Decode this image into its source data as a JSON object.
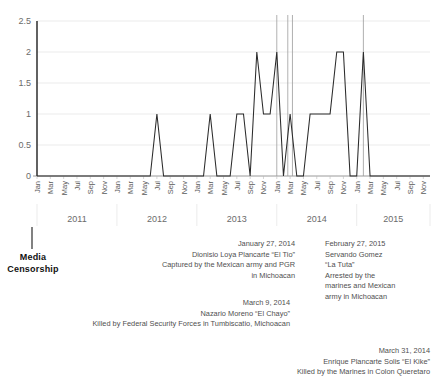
{
  "chart_data": {
    "type": "line",
    "title": "",
    "xlabel": "",
    "ylabel": "",
    "ylim": [
      0,
      2.5
    ],
    "grid": true,
    "legend": "none",
    "y_ticks": [
      "0",
      "0.5",
      "1",
      "1.5",
      "2",
      "2.5"
    ],
    "y_tick_values": [
      0,
      0.5,
      1,
      1.5,
      2,
      2.5
    ],
    "month_ticks": [
      "Jan",
      "Mar",
      "May",
      "Jul",
      "Sep",
      "Nov"
    ],
    "years": [
      "2011",
      "2012",
      "2013",
      "2014",
      "2015"
    ],
    "x_start": "2011-01",
    "x_end": "2015-12",
    "x": [
      "Jan 2011",
      "Feb 2011",
      "Mar 2011",
      "Apr 2011",
      "May 2011",
      "Jun 2011",
      "Jul 2011",
      "Aug 2011",
      "Sep 2011",
      "Oct 2011",
      "Nov 2011",
      "Dec 2011",
      "Jan 2012",
      "Feb 2012",
      "Mar 2012",
      "Apr 2012",
      "May 2012",
      "Jun 2012",
      "Jul 2012",
      "Aug 2012",
      "Sep 2012",
      "Oct 2012",
      "Nov 2012",
      "Dec 2012",
      "Jan 2013",
      "Feb 2013",
      "Mar 2013",
      "Apr 2013",
      "May 2013",
      "Jun 2013",
      "Jul 2013",
      "Aug 2013",
      "Sep 2013",
      "Oct 2013",
      "Nov 2013",
      "Dec 2013",
      "Jan 2014",
      "Feb 2014",
      "Mar 2014",
      "Apr 2014",
      "May 2014",
      "Jun 2014",
      "Jul 2014",
      "Aug 2014",
      "Sep 2014",
      "Oct 2014",
      "Nov 2014",
      "Dec 2014",
      "Jan 2015",
      "Feb 2015",
      "Mar 2015",
      "Apr 2015",
      "May 2015",
      "Jun 2015",
      "Jul 2015",
      "Aug 2015",
      "Sep 2015",
      "Oct 2015",
      "Nov 2015",
      "Dec 2015"
    ],
    "values": [
      0,
      0,
      0,
      0,
      0,
      0,
      0,
      0,
      0,
      0,
      0,
      0,
      0,
      0,
      0,
      0,
      0,
      0,
      1,
      0,
      0,
      0,
      0,
      0,
      0,
      0,
      1,
      0,
      0,
      0,
      1,
      1,
      0,
      2,
      1,
      1,
      2,
      0,
      1,
      0,
      0,
      1,
      1,
      1,
      1,
      2,
      2,
      0,
      0,
      2,
      0,
      0,
      0,
      0,
      0,
      0,
      0,
      0,
      0,
      0
    ],
    "event_lines": [
      {
        "label": "January 27, 2014",
        "x": "Jan 2014"
      },
      {
        "label": "March 9, 2014",
        "x": "Mar 2014"
      },
      {
        "label": "March 31, 2014",
        "x": "Mar 2014"
      },
      {
        "label": "February 27, 2015",
        "x": "Feb 2015"
      }
    ]
  },
  "censorship": {
    "line1": "Media",
    "line2": "Censorship"
  },
  "annotations": [
    {
      "id": "el-tio",
      "lines": [
        "January 27, 2014",
        "Dionisio Loya Plancarte “El Tio”",
        "Captured by the Mexican army and PGR",
        "in Michoacan"
      ]
    },
    {
      "id": "el-chayo",
      "lines": [
        "March 9, 2014",
        "Nazario Moreno “El Chayo”",
        "Killed by Federal Security Forces in Tumbiscatio, Michoacan"
      ]
    },
    {
      "id": "el-kike",
      "lines": [
        "March 31, 2014",
        "Enrique Plancarte Solis “El Kike”",
        "Killed by the Marines in Colon Queretaro"
      ]
    },
    {
      "id": "la-tuta",
      "lines": [
        "February 27, 2015",
        "Servando Gomez",
        "“La Tuta”",
        "Arrested by the",
        "marines and Mexican",
        "army in Michoacan"
      ]
    }
  ],
  "colors": {
    "series": "#2b2b2b",
    "grid": "#e3e3e3",
    "axis": "#9a9a9a",
    "event": "#9c9c9c",
    "text": "#4f4f4f"
  }
}
